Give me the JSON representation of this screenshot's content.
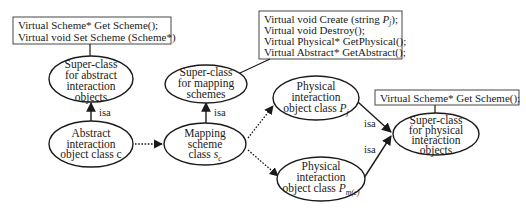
{
  "diagram": {
    "nodes": {
      "abstract_super": {
        "lines": [
          "Super-class",
          "for abstract",
          "interaction",
          "objects"
        ]
      },
      "abstract_class": {
        "lines": [
          "Abstract",
          "interaction",
          "object class c"
        ]
      },
      "mapping_super": {
        "lines": [
          "Super-class",
          "for mapping",
          "schemes"
        ]
      },
      "mapping_class": {
        "line1": "Mapping",
        "line2": "scheme",
        "line3_prefix": "class ",
        "line3_var": "s",
        "line3_sub": "c"
      },
      "physical_j": {
        "line1": "Physical",
        "line2": "interaction",
        "line3_prefix": "object class ",
        "line3_var": "P",
        "line3_sub": "j"
      },
      "physical_mc": {
        "line1": "Physical",
        "line2": "interaction",
        "line3_prefix": "object class ",
        "line3_var": "P",
        "line3_sub": "m(c)"
      },
      "physical_super": {
        "lines": [
          "Super-class",
          "for physical",
          "interaction",
          "objects"
        ]
      }
    },
    "boxes": {
      "abstract_methods": [
        "Virtual Scheme* Get Scheme();",
        "Virtual void Set Scheme (Scheme*)"
      ],
      "mapping_methods": {
        "line1_prefix": "Virtual void Create (string ",
        "line1_var": "P",
        "line1_sub": "j",
        "line1_suffix": ");",
        "line2": "Virtual void Destroy();",
        "line3": "Virtual Physical* GetPhysical();",
        "line4": "Virtual Abstract* GetAbstract();"
      },
      "physical_methods": [
        "Virtual Scheme* Get Scheme();"
      ]
    },
    "edges": {
      "abstract_isa": "isa",
      "mapping_isa": "isa",
      "physical_j_isa": "isa",
      "physical_mc_isa": "isa"
    }
  }
}
